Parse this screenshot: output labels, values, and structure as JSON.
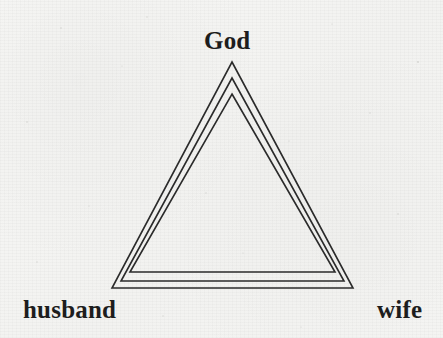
{
  "diagram": {
    "shape": "nested-triangles",
    "nested_outline_count": 3,
    "line_color": "#2b2b2b",
    "background_color": "#f5f5f3",
    "vertices": [
      {
        "id": "apex",
        "label": "God",
        "position": "top"
      },
      {
        "id": "bottom-left",
        "label": "husband",
        "position": "bottom-left"
      },
      {
        "id": "bottom-right",
        "label": "wife",
        "position": "bottom-right"
      }
    ],
    "outlines": [
      {
        "index": 1,
        "points": "232,62 353,288 112,288"
      },
      {
        "index": 2,
        "points": "232,78 344,281 121,281"
      },
      {
        "index": 3,
        "points": "232,94 335,272 130,272"
      }
    ],
    "speckles": [
      {
        "cx": 61,
        "cy": 28,
        "r": 0.8
      },
      {
        "cx": 147,
        "cy": 17,
        "r": 0.7
      },
      {
        "cx": 332,
        "cy": 24,
        "r": 0.6
      },
      {
        "cx": 418,
        "cy": 62,
        "r": 0.9
      },
      {
        "cx": 27,
        "cy": 122,
        "r": 0.8
      },
      {
        "cx": 89,
        "cy": 206,
        "r": 0.6
      },
      {
        "cx": 206,
        "cy": 193,
        "r": 0.7
      },
      {
        "cx": 289,
        "cy": 141,
        "r": 0.6
      },
      {
        "cx": 398,
        "cy": 214,
        "r": 0.8
      },
      {
        "cx": 163,
        "cy": 316,
        "r": 0.7
      },
      {
        "cx": 301,
        "cy": 327,
        "r": 0.6
      },
      {
        "cx": 37,
        "cy": 262,
        "r": 0.7
      },
      {
        "cx": 243,
        "cy": 253,
        "r": 0.6
      },
      {
        "cx": 370,
        "cy": 113,
        "r": 0.7
      },
      {
        "cx": 122,
        "cy": 66,
        "r": 0.6
      }
    ]
  }
}
